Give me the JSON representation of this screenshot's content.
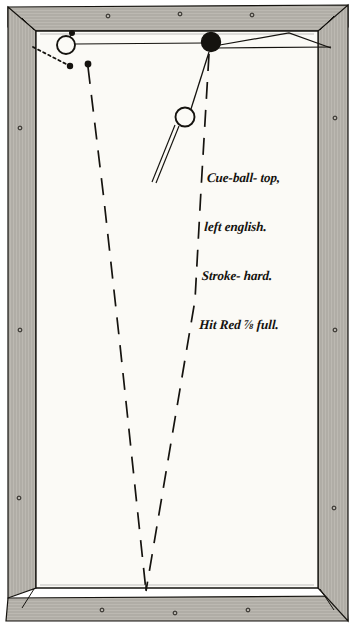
{
  "figure": {
    "kind": "billiards-shot-diagram",
    "medium": "engraved line drawing on paper",
    "table_bed_color": "#fbfaf6",
    "ink_color": "#15130f",
    "rail_wood_color": "#e8e6e0",
    "page_background": "#ffffff"
  },
  "annotation": {
    "lines": [
      "Cue-ball- top,",
      "left english.",
      "Stroke- hard.",
      "Hit Red ⅞ full."
    ],
    "full_text": "Cue-ball- top, left english. Stroke- hard. Hit Red ⅞ full.",
    "fraction": "⅞",
    "style": "handwritten italic script"
  },
  "balls": [
    {
      "name": "object-ball-white",
      "label": "white ball",
      "fill": "none",
      "cx": 66,
      "cy": 45,
      "r": 9
    },
    {
      "name": "red-ball",
      "label": "Red",
      "fill": "#15130f",
      "cx": 211,
      "cy": 42,
      "r": 9.5
    },
    {
      "name": "cue-ball",
      "label": "Cue-ball",
      "fill": "none",
      "cx": 185,
      "cy": 117,
      "r": 9.5
    }
  ],
  "markers": [
    {
      "name": "spot-above-white-ball",
      "cx": 72,
      "cy": 33,
      "r": 3
    },
    {
      "name": "spot-dotted-path-end",
      "cx": 71,
      "cy": 66,
      "r": 3.2
    },
    {
      "name": "spot-left-dashed-start",
      "cx": 88,
      "cy": 64,
      "r": 3.4
    }
  ],
  "paths": {
    "cue_stick": {
      "name": "cue-stick",
      "from": [
        178,
        126
      ],
      "to": [
        155,
        182
      ]
    },
    "cue_to_red": {
      "name": "cue-ball-to-red-line",
      "from": [
        190,
        109
      ],
      "to": [
        209,
        53
      ]
    },
    "rail_line_left": {
      "name": "top-rail-contact-line",
      "from": [
        75,
        44
      ],
      "to": [
        205,
        44
      ]
    },
    "dotted_deflection": {
      "name": "dotted-deflection-path",
      "from": [
        33,
        48
      ],
      "to": [
        69,
        66
      ]
    },
    "left_dashed": {
      "name": "left-dashed-travel-path",
      "points": [
        [
          88,
          66
        ],
        [
          119,
          330
        ],
        [
          146,
          592
        ]
      ]
    },
    "right_dashed": {
      "name": "right-dashed-travel-path",
      "points": [
        [
          209,
          53
        ],
        [
          196,
          280
        ],
        [
          146,
          592
        ]
      ]
    },
    "rail_angle_right": {
      "name": "red-ball-rail-angle-line",
      "points": [
        [
          213,
          46
        ],
        [
          289,
          33
        ],
        [
          330,
          47
        ]
      ]
    }
  },
  "table": {
    "outer": {
      "x": 6,
      "y": 7,
      "w": 342,
      "h": 614
    },
    "bed": {
      "x": 36,
      "y": 31,
      "w": 282,
      "h": 557
    },
    "pocket_studs": [
      [
        20,
        120
      ],
      [
        20,
        330
      ],
      [
        20,
        500
      ],
      [
        334,
        118
      ],
      [
        334,
        330
      ],
      [
        334,
        508
      ],
      [
        100,
        613
      ],
      [
        176,
        615
      ],
      [
        248,
        612
      ],
      [
        108,
        14
      ],
      [
        180,
        12
      ],
      [
        252,
        14
      ]
    ]
  }
}
